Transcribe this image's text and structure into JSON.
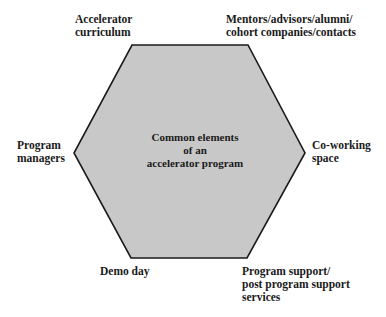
{
  "diagram": {
    "type": "hexagon",
    "center": {
      "lines": [
        "Common elements",
        "of an",
        "accelerator program"
      ]
    },
    "style": {
      "fill": "#c8c8c8",
      "stroke": "#1a1a1a",
      "text_color": "#1a1a1a"
    },
    "vertices": {
      "top_left": {
        "lines": [
          "Accelerator",
          "curriculum"
        ]
      },
      "top_right": {
        "lines": [
          "Mentors/advisors/alumni/",
          "cohort companies/contacts"
        ]
      },
      "left": {
        "lines": [
          "Program",
          "managers"
        ]
      },
      "right": {
        "lines": [
          "Co-working",
          "space"
        ]
      },
      "bottom_left": {
        "lines": [
          "Demo day"
        ]
      },
      "bottom_right": {
        "lines": [
          "Program support/",
          "post program support",
          "services"
        ]
      }
    }
  }
}
